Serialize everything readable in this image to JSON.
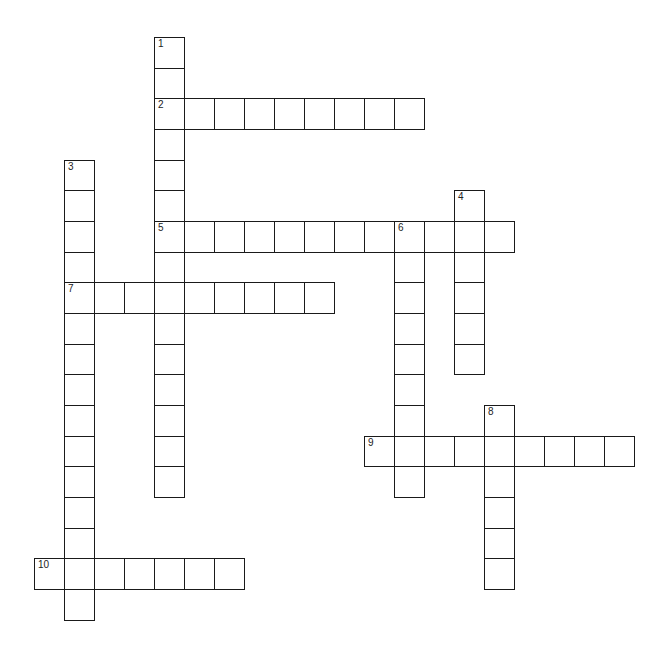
{
  "puzzle": {
    "type": "crossword",
    "grid": {
      "origin_x": 34,
      "origin_y": 37,
      "cell_width": 30,
      "cell_height": 30.67,
      "line_color": "#1a1a1a",
      "cell_color": "#ffffff"
    },
    "entries": [
      {
        "number": "1",
        "direction": "down",
        "col": 4,
        "row": 0,
        "length": 15
      },
      {
        "number": "2",
        "direction": "across",
        "col": 4,
        "row": 2,
        "length": 9
      },
      {
        "number": "3",
        "direction": "down",
        "col": 1,
        "row": 4,
        "length": 15
      },
      {
        "number": "4",
        "direction": "down",
        "col": 14,
        "row": 5,
        "length": 6
      },
      {
        "number": "5",
        "direction": "across",
        "col": 4,
        "row": 6,
        "length": 12
      },
      {
        "number": "6",
        "direction": "down",
        "col": 12,
        "row": 6,
        "length": 9
      },
      {
        "number": "7",
        "direction": "across",
        "col": 1,
        "row": 8,
        "length": 9
      },
      {
        "number": "8",
        "direction": "down",
        "col": 15,
        "row": 12,
        "length": 6
      },
      {
        "number": "9",
        "direction": "across",
        "col": 11,
        "row": 13,
        "length": 9
      },
      {
        "number": "10",
        "direction": "across",
        "col": 0,
        "row": 17,
        "length": 7
      }
    ]
  }
}
